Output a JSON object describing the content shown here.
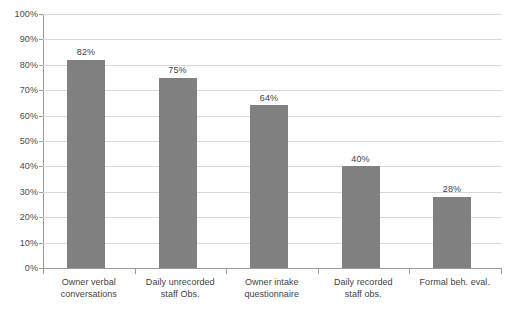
{
  "chart_data": {
    "type": "bar",
    "title": "",
    "subtitle": "",
    "xlabel": "",
    "ylabel": "",
    "ylim": [
      0,
      100
    ],
    "y_ticks": [
      "0%",
      "10%",
      "20%",
      "30%",
      "40%",
      "50%",
      "60%",
      "70%",
      "80%",
      "90%",
      "100%"
    ],
    "y_tick_values": [
      0,
      10,
      20,
      30,
      40,
      50,
      60,
      70,
      80,
      90,
      100
    ],
    "grid": true,
    "legend": "none",
    "categories": [
      "Owner verbal conversations",
      "Daily unrecorded staff Obs.",
      "Owner intake questionnaire",
      "Daily recorded staff obs.",
      "Formal beh. eval."
    ],
    "category_lines": [
      [
        "Owner verbal",
        "conversations"
      ],
      [
        "Daily unrecorded",
        "staff Obs."
      ],
      [
        "Owner intake",
        "questionnaire"
      ],
      [
        "Daily recorded",
        "staff obs."
      ],
      [
        "Formal beh. eval.",
        ""
      ]
    ],
    "values": [
      82,
      75,
      64,
      40,
      28
    ],
    "data_labels": [
      "82%",
      "75%",
      "64%",
      "40%",
      "28%"
    ],
    "colors": {
      "bar": "#808080",
      "gridline": "#d8d8d8",
      "axis": "#9a9a9a",
      "text": "#3f3f3f",
      "background": "#ffffff"
    }
  }
}
